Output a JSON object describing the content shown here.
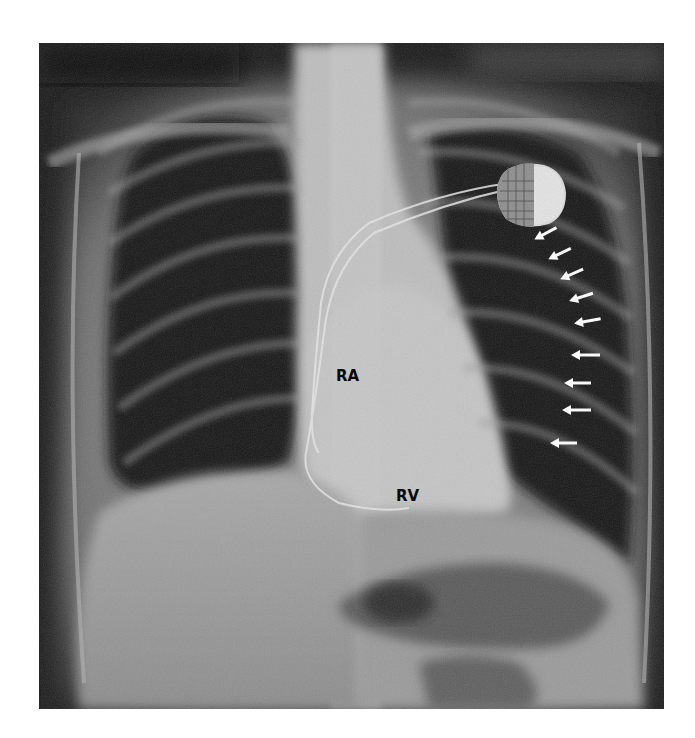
{
  "figure": {
    "type": "chest radiograph (PA view)",
    "labels": [
      {
        "id": "ra",
        "text": "RA",
        "x": 336,
        "y": 367
      },
      {
        "id": "rv",
        "text": "RV",
        "x": 396,
        "y": 487
      }
    ],
    "annotations": {
      "arrows": {
        "count": 9,
        "color": "#ffffff",
        "direction": "pointing-left-downward toward left heart border",
        "tips": [
          [
            537,
            238
          ],
          [
            551,
            258
          ],
          [
            563,
            278
          ],
          [
            572,
            300
          ],
          [
            577,
            323
          ],
          [
            574,
            355
          ],
          [
            567,
            383
          ],
          [
            565,
            410
          ],
          [
            553,
            443
          ]
        ]
      },
      "device": {
        "name": "pacemaker-generator",
        "icon": "pacemaker-icon"
      },
      "leads": {
        "name": "pacing-leads",
        "icon": "lead-wire-icon"
      }
    },
    "colors": {
      "background": "#ffffff",
      "lung": "#141414",
      "soft_tissue": "#8a8a8a",
      "bone": "#b8b8b8",
      "label_text": "#0a0a0a",
      "arrow": "#ffffff"
    }
  }
}
